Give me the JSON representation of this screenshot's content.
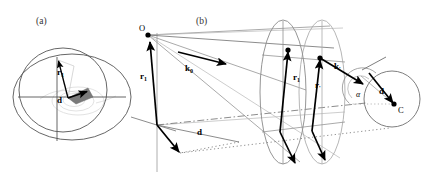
{
  "figure": {
    "background": "#ffffff",
    "width": 422,
    "height": 177
  },
  "colors": {
    "stroke_dark": "#000000",
    "stroke_mid": "#555555",
    "stroke_light": "#999999",
    "stroke_faint": "#bbbbbb",
    "fill_gray": "#808080",
    "fill_dark_gray": "#606060",
    "label_gray": "#333333"
  },
  "panels": [
    {
      "id": "a",
      "label": "(a)",
      "label_x": 36,
      "label_y": 24,
      "description": "Two-dimensional cross-section: outer ellipse, inner circle, crosshair axes, vectors r1 and d meeting at an origin with a shaded cone",
      "elements": {
        "outer_ellipse": {
          "cx": 72,
          "cy": 97,
          "rx": 59,
          "ry": 43
        },
        "inner_circle": {
          "cx": 63,
          "cy": 90,
          "rx": 44,
          "ry": 42
        },
        "axis_horizontal": {
          "x1": 18,
          "y1": 97,
          "x2": 126,
          "y2": 97
        },
        "axis_vertical": {
          "x1": 57,
          "y1": 58,
          "x2": 57,
          "y2": 140
        }
      },
      "vectors": [
        {
          "name": "r1",
          "label": "r",
          "subscript": "1",
          "label_x": 58,
          "label_y": 74,
          "from": [
            68,
            98
          ],
          "to": [
            58,
            60
          ]
        },
        {
          "name": "d",
          "label": "d",
          "subscript": "",
          "label_x": 58,
          "label_y": 101,
          "from": [
            68,
            98
          ],
          "to": [
            86,
            92
          ]
        }
      ]
    },
    {
      "id": "b",
      "label": "(b)",
      "label_x": 196,
      "label_y": 24,
      "description": "Three-dimensional perspective: apex O, incident wave vector k0, two elliptical disk planes carrying vectors r1 and r-prime, scattered vector k-prime, angle alpha, displacement d, and detector centre C",
      "points": [
        {
          "name": "O",
          "label": "O",
          "x": 147,
          "y": 34,
          "label_x": 140,
          "label_y": 31
        },
        {
          "name": "C",
          "label": "C",
          "x": 396,
          "y": 103,
          "label_x": 399,
          "label_y": 112
        }
      ],
      "vectors": [
        {
          "name": "k0",
          "label": "k",
          "subscript": "0",
          "label_x": 186,
          "label_y": 68,
          "from": [
            178,
            53
          ],
          "to": [
            224,
            63
          ]
        },
        {
          "name": "r1-left",
          "label": "r",
          "subscript": "1",
          "label_x": 143,
          "label_y": 77,
          "from": [
            157,
            125
          ],
          "to": [
            150,
            40
          ]
        },
        {
          "name": "d-left",
          "label": "d",
          "subscript": "",
          "label_x": 199,
          "label_y": 133,
          "from": [
            157,
            125
          ],
          "to": [
            180,
            153
          ]
        },
        {
          "name": "r1-disk",
          "label": "r",
          "subscript": "1",
          "label_x": 296,
          "label_y": 77,
          "from": [
            280,
            132
          ],
          "to": [
            288,
            50
          ]
        },
        {
          "name": "rprime-disk",
          "label": "r",
          "subscript": "'",
          "label_x": 318,
          "label_y": 85,
          "from": [
            312,
            131
          ],
          "to": [
            320,
            58
          ]
        },
        {
          "name": "kprime",
          "label": "k",
          "subscript": "'",
          "label_x": 337,
          "label_y": 67,
          "from": [
            320,
            58
          ],
          "to": [
            362,
            83
          ]
        },
        {
          "name": "d-right",
          "label": "d",
          "subscript": "",
          "label_x": 381,
          "label_y": 92,
          "from": [
            369,
            74
          ],
          "to": [
            394,
            104
          ]
        }
      ],
      "angle": {
        "name": "alpha",
        "label": "α",
        "label_x": 360,
        "label_y": 94
      },
      "shapes": {
        "disk_front": {
          "cx": 283,
          "cy": 92,
          "rx": 23,
          "ry": 72
        },
        "disk_back": {
          "cx": 320,
          "cy": 92,
          "rx": 23,
          "ry": 72
        },
        "detector_circle": {
          "cx": 392,
          "cy": 99,
          "rx": 28,
          "ry": 28
        },
        "small_arc": {
          "cx": 366,
          "cy": 89,
          "r": 17
        }
      }
    }
  ]
}
